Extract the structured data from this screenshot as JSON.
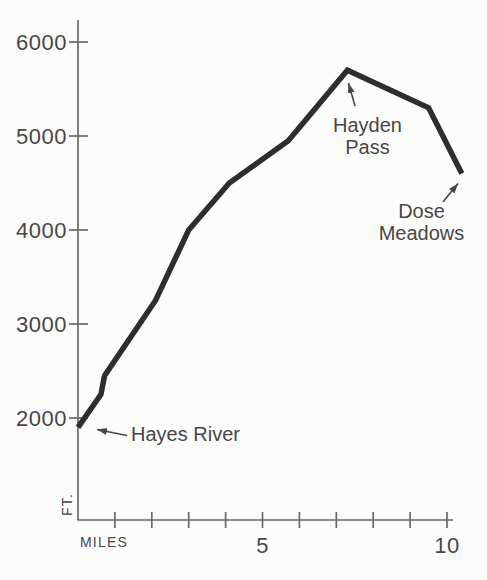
{
  "chart_data": {
    "type": "line",
    "title": "",
    "xlabel": "MILES",
    "ylabel": "FT.",
    "x_ticks": [
      1,
      2,
      3,
      4,
      5,
      6,
      7,
      8,
      9,
      10
    ],
    "x_tick_labels": [
      {
        "value": 5,
        "label": "5"
      },
      {
        "value": 10,
        "label": "10"
      }
    ],
    "y_ticks": [
      {
        "value": 2000,
        "label": "2000"
      },
      {
        "value": 3000,
        "label": "3000"
      },
      {
        "value": 4000,
        "label": "4000"
      },
      {
        "value": 5000,
        "label": "5000"
      },
      {
        "value": 6000,
        "label": "6000"
      }
    ],
    "xlim": [
      0,
      10.4
    ],
    "ylim": [
      2000,
      6000
    ],
    "grid": false,
    "legend": null,
    "series": [
      {
        "name": "trail-elevation-profile",
        "points": [
          {
            "mile": 0.0,
            "ft": 1900
          },
          {
            "mile": 0.62,
            "ft": 2250
          },
          {
            "mile": 0.72,
            "ft": 2450
          },
          {
            "mile": 2.1,
            "ft": 3250
          },
          {
            "mile": 3.0,
            "ft": 4000
          },
          {
            "mile": 4.1,
            "ft": 4500
          },
          {
            "mile": 5.7,
            "ft": 4950
          },
          {
            "mile": 7.3,
            "ft": 5700
          },
          {
            "mile": 9.5,
            "ft": 5300
          },
          {
            "mile": 10.4,
            "ft": 4600
          }
        ]
      }
    ],
    "annotations": [
      {
        "id": "hayes-river",
        "lines": [
          "Hayes River"
        ],
        "mile": 0.0,
        "ft": 1900
      },
      {
        "id": "hayden-pass",
        "lines": [
          "Hayden",
          "Pass"
        ],
        "mile": 7.3,
        "ft": 5700
      },
      {
        "id": "dose-meadows",
        "lines": [
          "Dose",
          "Meadows"
        ],
        "mile": 10.4,
        "ft": 4600
      }
    ],
    "colors": {
      "line": "#2e2e2e",
      "axis": "#6a6a6a",
      "text": "#474747",
      "background": "#fcfcfa"
    }
  }
}
